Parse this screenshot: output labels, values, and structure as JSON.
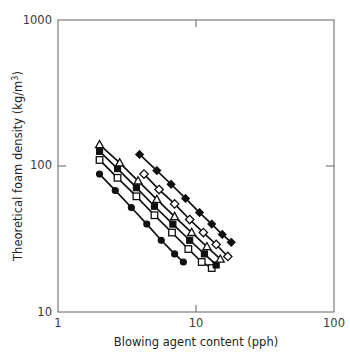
{
  "figure": {
    "title": "",
    "background_color": "#ffffff",
    "frame_color": "#6f6f6f",
    "marker_color": "#101010"
  },
  "axes": {
    "x": {
      "label": "Blowing agent content (pph)",
      "scale": "log",
      "min": 1,
      "max": 100,
      "ticks": [
        1,
        10,
        100
      ],
      "tick_labels": [
        "1",
        "10",
        "100"
      ]
    },
    "y": {
      "label": "Theoretical foam density (kg/m",
      "label_superscript": "3",
      "label_suffix": ")",
      "label_full": "Theoretical foam density (kg/m3)",
      "scale": "log",
      "min": 10,
      "max": 1000,
      "ticks": [
        10,
        100,
        1000
      ],
      "tick_labels": [
        "10",
        "100",
        "1000"
      ]
    }
  },
  "chart_data": {
    "type": "line",
    "title": "",
    "xlabel": "Blowing agent content (pph)",
    "ylabel": "Theoretical foam density (kg/m3)",
    "xscale": "log",
    "yscale": "log",
    "xlim": [
      1,
      100
    ],
    "ylim": [
      10,
      1000
    ],
    "grid": false,
    "legend": "none",
    "series": [
      {
        "name": "series-1",
        "marker": "filled-circle",
        "marker_filled": true,
        "points": [
          {
            "x": 2.0,
            "y": 88
          },
          {
            "x": 2.6,
            "y": 68
          },
          {
            "x": 3.4,
            "y": 52
          },
          {
            "x": 4.4,
            "y": 40
          },
          {
            "x": 5.6,
            "y": 31
          },
          {
            "x": 7.0,
            "y": 25
          },
          {
            "x": 8.1,
            "y": 22
          }
        ]
      },
      {
        "name": "series-2",
        "marker": "open-square",
        "marker_filled": false,
        "points": [
          {
            "x": 2.0,
            "y": 110
          },
          {
            "x": 2.7,
            "y": 83
          },
          {
            "x": 3.7,
            "y": 62
          },
          {
            "x": 5.0,
            "y": 46
          },
          {
            "x": 6.7,
            "y": 35
          },
          {
            "x": 8.8,
            "y": 27
          },
          {
            "x": 11.0,
            "y": 22
          },
          {
            "x": 13.0,
            "y": 20
          }
        ]
      },
      {
        "name": "series-3",
        "marker": "filled-square",
        "marker_filled": true,
        "points": [
          {
            "x": 2.0,
            "y": 126
          },
          {
            "x": 2.7,
            "y": 96
          },
          {
            "x": 3.7,
            "y": 71
          },
          {
            "x": 5.0,
            "y": 53
          },
          {
            "x": 6.8,
            "y": 40
          },
          {
            "x": 9.0,
            "y": 31
          },
          {
            "x": 11.5,
            "y": 25
          },
          {
            "x": 14.0,
            "y": 21
          }
        ]
      },
      {
        "name": "series-4",
        "marker": "open-triangle",
        "marker_filled": false,
        "points": [
          {
            "x": 2.0,
            "y": 140
          },
          {
            "x": 2.8,
            "y": 105
          },
          {
            "x": 3.8,
            "y": 79
          },
          {
            "x": 5.2,
            "y": 59
          },
          {
            "x": 7.0,
            "y": 45
          },
          {
            "x": 9.3,
            "y": 35
          },
          {
            "x": 12.0,
            "y": 28
          },
          {
            "x": 15.0,
            "y": 23
          }
        ]
      },
      {
        "name": "series-5",
        "marker": "open-diamond",
        "marker_filled": false,
        "points": [
          {
            "x": 4.2,
            "y": 88
          },
          {
            "x": 5.4,
            "y": 69
          },
          {
            "x": 7.0,
            "y": 55
          },
          {
            "x": 9.0,
            "y": 43
          },
          {
            "x": 11.3,
            "y": 35
          },
          {
            "x": 14.0,
            "y": 29
          },
          {
            "x": 17.0,
            "y": 24
          }
        ]
      },
      {
        "name": "series-6",
        "marker": "filled-diamond",
        "marker_filled": true,
        "points": [
          {
            "x": 3.9,
            "y": 120
          },
          {
            "x": 5.2,
            "y": 93
          },
          {
            "x": 6.6,
            "y": 75
          },
          {
            "x": 8.4,
            "y": 60
          },
          {
            "x": 10.6,
            "y": 48
          },
          {
            "x": 13.0,
            "y": 40
          },
          {
            "x": 15.5,
            "y": 34
          },
          {
            "x": 18.0,
            "y": 30
          }
        ]
      }
    ]
  }
}
